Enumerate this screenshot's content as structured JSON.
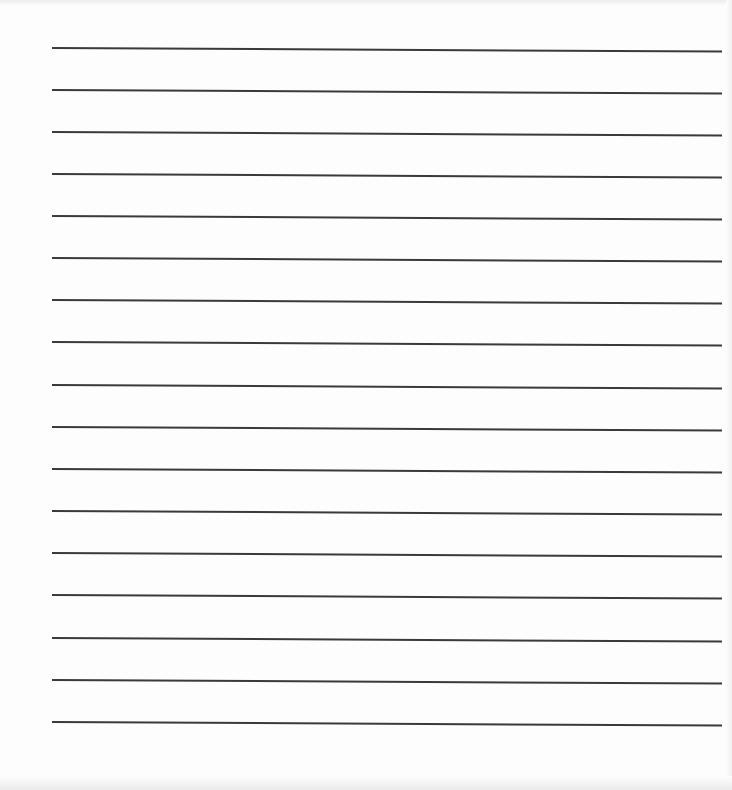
{
  "page": {
    "type": "lined-paper",
    "background_color": "#fdfdfd",
    "line_color": "#3a3a3a",
    "line_count": 17,
    "line_positions_y": [
      47,
      89,
      131,
      173,
      215,
      257,
      299,
      341,
      384,
      426,
      468,
      510,
      552,
      594,
      637,
      679,
      721
    ]
  }
}
